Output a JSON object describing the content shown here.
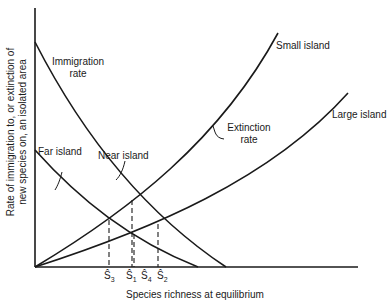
{
  "figure": {
    "y_axis_label_line1": "Rate of immigration to, or extinction of",
    "y_axis_label_line2": "new species on, an isolated area",
    "x_axis_label": "Species richness at equilibrium",
    "labels": {
      "immigration_line1": "Immigration",
      "immigration_line2": "rate",
      "far_island": "Far island",
      "near_island": "Near island",
      "small_island": "Small island",
      "large_island": "Large island",
      "extinction_line1": "Extinction",
      "extinction_line2": "rate"
    },
    "ticks": [
      {
        "symbol": "Ŝ",
        "sub": "3"
      },
      {
        "symbol": "Ŝ",
        "sub": "1"
      },
      {
        "symbol": "Ŝ",
        "sub": "4"
      },
      {
        "symbol": "Ŝ",
        "sub": "2"
      }
    ],
    "colors": {
      "line": "#1a1a1a",
      "background": "#ffffff"
    }
  }
}
